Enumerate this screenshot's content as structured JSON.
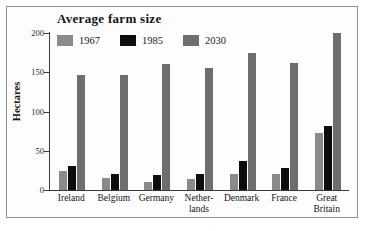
{
  "chart_data": {
    "type": "bar",
    "title": "Average farm size",
    "xlabel": "",
    "ylabel": "Hectares",
    "ylim": [
      0,
      200
    ],
    "yticks": [
      0,
      50,
      100,
      150,
      200
    ],
    "grid": false,
    "legend_position": "top-left",
    "categories": [
      "Ireland",
      "Belgium",
      "Germany",
      "Netherlands",
      "Denmark",
      "France",
      "Great Britain"
    ],
    "category_lines": [
      [
        "Ireland"
      ],
      [
        "Belgium"
      ],
      [
        "Germany"
      ],
      [
        "Nether-",
        "lands"
      ],
      [
        "Denmark"
      ],
      [
        "France"
      ],
      [
        "Great",
        "Britain"
      ]
    ],
    "series": [
      {
        "name": "1967",
        "color": "#8a8a8a",
        "values": [
          24,
          15,
          10,
          14,
          20,
          20,
          72
        ]
      },
      {
        "name": "1985",
        "color": "#0d0d0d",
        "values": [
          31,
          20,
          19,
          21,
          37,
          28,
          81
        ]
      },
      {
        "name": "2030",
        "color": "#6e6e6e",
        "values": [
          147,
          147,
          160,
          156,
          174,
          162,
          200
        ]
      }
    ]
  },
  "figure": {
    "border_color": "#8f8f8f",
    "background": "#fdfdfd",
    "axis_color": "#3a3a3a",
    "text_color": "#141414"
  }
}
